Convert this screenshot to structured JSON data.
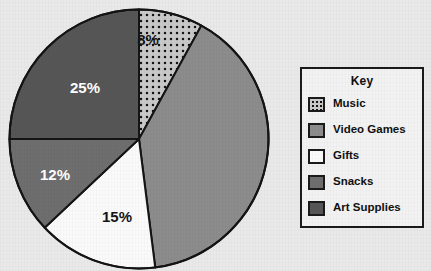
{
  "background_color": "#e9e9e9",
  "chart_data": {
    "type": "pie",
    "title": "",
    "subtitle": "",
    "xlabel": "",
    "ylabel": "",
    "legend_position": "right",
    "grid": false,
    "start_angle_deg": 0,
    "direction": "clockwise",
    "units": "percent",
    "total": 100,
    "categories": [
      "Music",
      "Video Games",
      "Gifts",
      "Snacks",
      "Art Supplies"
    ],
    "values": [
      8,
      40,
      15,
      12,
      25
    ],
    "labels_shown": [
      "8%",
      "40%",
      "15%",
      "12%",
      "25%"
    ],
    "slices": [
      {
        "name": "Music",
        "value": 8,
        "label": "8%",
        "label_visible": true,
        "fill": "#c9c9c9",
        "pattern": "dots",
        "label_color": "#151515"
      },
      {
        "name": "Video Games",
        "value": 40,
        "label": "40%",
        "label_visible": false,
        "fill": "#8c8c8c",
        "pattern": "solid",
        "label_color": "#ffffff"
      },
      {
        "name": "Gifts",
        "value": 15,
        "label": "15%",
        "label_visible": true,
        "fill": "#fafafa",
        "pattern": "solid",
        "label_color": "#151515"
      },
      {
        "name": "Snacks",
        "value": 12,
        "label": "12%",
        "label_visible": true,
        "fill": "#6e6e6e",
        "pattern": "solid",
        "label_color": "#ffffff"
      },
      {
        "name": "Art Supplies",
        "value": 25,
        "label": "25%",
        "label_visible": true,
        "fill": "#565656",
        "pattern": "solid",
        "label_color": "#ffffff"
      }
    ],
    "outline_color": "#141414"
  },
  "slice_labels": {
    "music": "8%",
    "art_supplies": "25%",
    "snacks": "12%",
    "gifts": "15%"
  },
  "legend": {
    "title": "Key",
    "border_color": "#1a1a1a",
    "background": "#f2f2f2",
    "items": [
      {
        "label": "Music",
        "swatch_color": "#c9c9c9",
        "pattern": "dots"
      },
      {
        "label": "Video Games",
        "swatch_color": "#8c8c8c",
        "pattern": "solid"
      },
      {
        "label": "Gifts",
        "swatch_color": "#fafafa",
        "pattern": "solid"
      },
      {
        "label": "Snacks",
        "swatch_color": "#6e6e6e",
        "pattern": "solid"
      },
      {
        "label": "Art Supplies",
        "swatch_color": "#565656",
        "pattern": "solid"
      }
    ]
  }
}
